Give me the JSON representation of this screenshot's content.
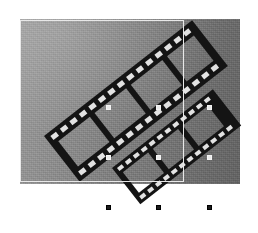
{
  "canvas": {
    "width": 258,
    "height": 233,
    "background_color": "#ffffff",
    "label": "filmstrip-selection-canvas"
  },
  "photo": {
    "name": "raster-image",
    "x": 20,
    "y": 19,
    "width": 220,
    "height": 165,
    "gradient_from": "#9a9a9a",
    "gradient_to": "#646464",
    "gradient_angle_deg": 100,
    "texture": "film-grain-noise",
    "alt_text": "Two dark filmstrips crossing diagonally over a gray gradient background"
  },
  "marquee": {
    "name": "selection-marquee",
    "x": 20,
    "y": 20,
    "width": 164,
    "height": 162,
    "stroke_color": "#e8e8e8",
    "stroke_width": 1,
    "style": "solid"
  },
  "filmstrips": [
    {
      "name": "filmstrip-upper",
      "angle_deg": -45,
      "frames": 4,
      "sprocket_color": "#e2e2e2",
      "body_color": "#141414",
      "start": [
        52,
        172
      ],
      "end": [
        200,
        56
      ]
    },
    {
      "name": "filmstrip-lower",
      "angle_deg": -45,
      "frames": 3,
      "sprocket_color": "#e2e2e2",
      "body_color": "#141414",
      "start": [
        117,
        192
      ],
      "end": [
        204,
        118
      ]
    }
  ],
  "handles": {
    "name": "selection-handles",
    "size": 5,
    "light_color": "#e9e9e9",
    "dark_color": "#1b1b1b",
    "columns_x": [
      108,
      158,
      209
    ],
    "rows_y": [
      107,
      157,
      207
    ],
    "items": [
      {
        "name": "handle-middle-left",
        "x": 108,
        "y": 107,
        "tone": "light"
      },
      {
        "name": "handle-middle-center",
        "x": 158,
        "y": 107,
        "tone": "light"
      },
      {
        "name": "handle-middle-right",
        "x": 209,
        "y": 107,
        "tone": "light"
      },
      {
        "name": "handle-lower-left",
        "x": 108,
        "y": 157,
        "tone": "light"
      },
      {
        "name": "handle-lower-center",
        "x": 158,
        "y": 157,
        "tone": "light"
      },
      {
        "name": "handle-lower-right",
        "x": 209,
        "y": 157,
        "tone": "light"
      },
      {
        "name": "handle-bottom-left",
        "x": 108,
        "y": 207,
        "tone": "dark"
      },
      {
        "name": "handle-bottom-center",
        "x": 158,
        "y": 207,
        "tone": "dark"
      },
      {
        "name": "handle-bottom-right",
        "x": 209,
        "y": 207,
        "tone": "dark"
      }
    ]
  }
}
